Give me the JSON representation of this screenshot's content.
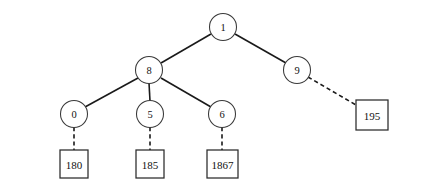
{
  "diagram": {
    "background_color": "#ffffff",
    "stroke_color": "#1a1a1a",
    "node_fill": "#ffffff",
    "circle_nodes": [
      {
        "id": "root",
        "label": "1",
        "cx": 223,
        "cy": 27,
        "r": 13.5
      },
      {
        "id": "n8",
        "label": "8",
        "cx": 149,
        "cy": 70,
        "r": 13.5
      },
      {
        "id": "n9",
        "label": "9",
        "cx": 297,
        "cy": 70,
        "r": 13.5
      },
      {
        "id": "n0",
        "label": "0",
        "cx": 74,
        "cy": 114,
        "r": 13.5
      },
      {
        "id": "n5",
        "label": "5",
        "cx": 150,
        "cy": 114,
        "r": 13.5
      },
      {
        "id": "n6",
        "label": "6",
        "cx": 222,
        "cy": 114,
        "r": 13.5
      }
    ],
    "box_nodes": [
      {
        "id": "b180",
        "label": "180",
        "x": 60,
        "y": 150,
        "w": 28,
        "h": 28
      },
      {
        "id": "b185",
        "label": "185",
        "x": 136,
        "y": 150,
        "w": 28,
        "h": 28
      },
      {
        "id": "b1867",
        "label": "1867",
        "x": 207,
        "y": 150,
        "w": 31,
        "h": 28
      },
      {
        "id": "b195",
        "label": "195",
        "x": 356,
        "y": 100,
        "w": 32,
        "h": 30
      }
    ],
    "edges": [
      {
        "id": "e-root-8",
        "from": "root",
        "to": "n8",
        "style": "solid",
        "x1": 211,
        "y1": 34,
        "x2": 161,
        "y2": 63
      },
      {
        "id": "e-root-9",
        "from": "root",
        "to": "n9",
        "style": "solid",
        "x1": 235,
        "y1": 34,
        "x2": 286,
        "y2": 63
      },
      {
        "id": "e-8-0",
        "from": "n8",
        "to": "n0",
        "style": "solid",
        "x1": 138,
        "y1": 78,
        "x2": 85,
        "y2": 107
      },
      {
        "id": "e-8-5",
        "from": "n8",
        "to": "n5",
        "style": "solid",
        "x1": 149,
        "y1": 83,
        "x2": 150,
        "y2": 101
      },
      {
        "id": "e-8-6",
        "from": "n8",
        "to": "n6",
        "style": "solid",
        "x1": 161,
        "y1": 78,
        "x2": 211,
        "y2": 107
      },
      {
        "id": "e-9-195",
        "from": "n9",
        "to": "b195",
        "style": "dashed",
        "x1": 308,
        "y1": 77,
        "x2": 356,
        "y2": 105
      },
      {
        "id": "e-0-180",
        "from": "n0",
        "to": "b180",
        "style": "dashed",
        "x1": 74,
        "y1": 127,
        "x2": 74,
        "y2": 150
      },
      {
        "id": "e-5-185",
        "from": "n5",
        "to": "b185",
        "style": "dashed",
        "x1": 150,
        "y1": 127,
        "x2": 150,
        "y2": 150
      },
      {
        "id": "e-6-1867",
        "from": "n6",
        "to": "b1867",
        "style": "dashed",
        "x1": 222,
        "y1": 127,
        "x2": 222,
        "y2": 150
      }
    ]
  }
}
